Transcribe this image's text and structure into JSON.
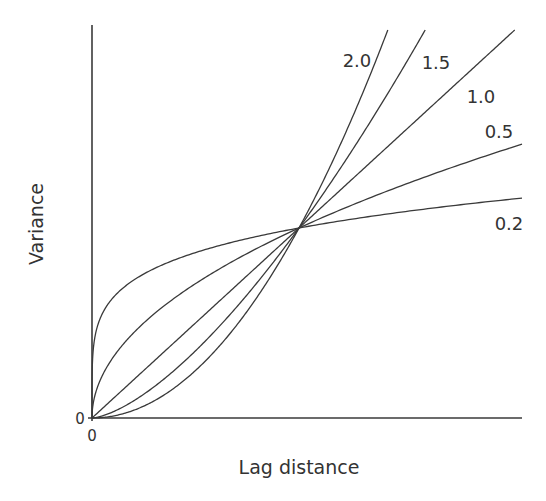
{
  "chart_data": {
    "type": "line",
    "title": "",
    "xlabel": "Lag distance",
    "ylabel": "Variance",
    "x_tick_labels": [
      "0"
    ],
    "y_tick_labels": [
      "0"
    ],
    "grid": false,
    "legend": "inline curve labels",
    "crossing_point": {
      "x": 1.0,
      "y": 1.0
    },
    "xlim": [
      0,
      2.08
    ],
    "ylim": [
      0,
      2.08
    ],
    "series": [
      {
        "name": "2.0",
        "exponent": 2.0,
        "x": [
          0,
          0.25,
          0.5,
          0.75,
          1.0,
          1.25,
          1.42
        ],
        "y": [
          0,
          0.0625,
          0.25,
          0.5625,
          1.0,
          1.5625,
          2.02
        ]
      },
      {
        "name": "1.5",
        "exponent": 1.5,
        "x": [
          0,
          0.25,
          0.5,
          0.75,
          1.0,
          1.25,
          1.6
        ],
        "y": [
          0,
          0.125,
          0.354,
          0.65,
          1.0,
          1.398,
          2.02
        ]
      },
      {
        "name": "1.0",
        "exponent": 1.0,
        "x": [
          0,
          0.5,
          1.0,
          1.5,
          2.08
        ],
        "y": [
          0,
          0.5,
          1.0,
          1.5,
          2.08
        ]
      },
      {
        "name": "0.5",
        "exponent": 0.5,
        "x": [
          0,
          0.25,
          0.5,
          1.0,
          1.5,
          2.08
        ],
        "y": [
          0,
          0.5,
          0.707,
          1.0,
          1.225,
          1.44
        ]
      },
      {
        "name": "0.2",
        "exponent": 0.2,
        "x": [
          0,
          0.05,
          0.25,
          0.5,
          1.0,
          1.5,
          2.08
        ],
        "y": [
          0,
          0.55,
          0.758,
          0.871,
          1.0,
          1.084,
          1.157
        ]
      }
    ]
  },
  "labels": {
    "x_axis": "Lag distance",
    "y_axis": "Variance",
    "x_origin": "0",
    "y_origin": "0",
    "curve_2_0": "2.0",
    "curve_1_5": "1.5",
    "curve_1_0": "1.0",
    "curve_0_5": "0.5",
    "curve_0_2": "0.2"
  }
}
